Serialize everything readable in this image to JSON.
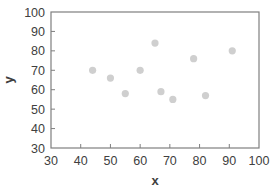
{
  "chart_data": {
    "type": "scatter",
    "title": "",
    "xlabel": "x",
    "ylabel": "y",
    "xlim": [
      30,
      100
    ],
    "ylim": [
      30,
      100
    ],
    "xticks": [
      30,
      40,
      50,
      60,
      70,
      80,
      90,
      100
    ],
    "yticks": [
      30,
      40,
      50,
      60,
      70,
      80,
      90,
      100
    ],
    "grid": false,
    "legend": null,
    "series": [
      {
        "name": "",
        "color": "#cfcfcf",
        "points": [
          {
            "x": 44,
            "y": 70
          },
          {
            "x": 50,
            "y": 66
          },
          {
            "x": 55,
            "y": 58
          },
          {
            "x": 60,
            "y": 70
          },
          {
            "x": 65,
            "y": 84
          },
          {
            "x": 67,
            "y": 59
          },
          {
            "x": 71,
            "y": 55
          },
          {
            "x": 78,
            "y": 76
          },
          {
            "x": 82,
            "y": 57
          },
          {
            "x": 91,
            "y": 80
          }
        ]
      }
    ]
  },
  "colors": {
    "frame": "#7f7f7f",
    "text": "#404040",
    "marker": "#cfcfcf"
  }
}
